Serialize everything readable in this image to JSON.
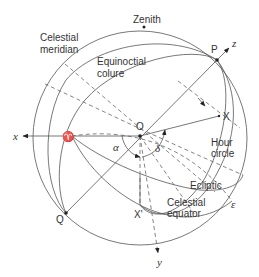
{
  "diagram": {
    "labels": {
      "zenith": "Zenith",
      "celestial_meridian_line1": "Celestial",
      "celestial_meridian_line2": "meridian",
      "equinoctial_colure_line1": "Equinoctial",
      "equinoctial_colure_line2": "colure",
      "hour_circle_line1": "Hour",
      "hour_circle_line2": "circle",
      "ecliptic": "Ecliptic",
      "celestial_equator_line1": "Celestial",
      "celestial_equator_line2": "equator",
      "epsilon": "ε",
      "point_P": "P",
      "point_O": "O",
      "point_X": "X",
      "point_X_prime": "X'",
      "point_Q": "Q",
      "vernal_equinox": "♈",
      "axis_x": "x",
      "axis_y": "y",
      "axis_z": "z",
      "alpha": "α",
      "delta": "δ"
    },
    "colors": {
      "line": "#555555",
      "text": "#333333",
      "background": "#ffffff"
    }
  }
}
